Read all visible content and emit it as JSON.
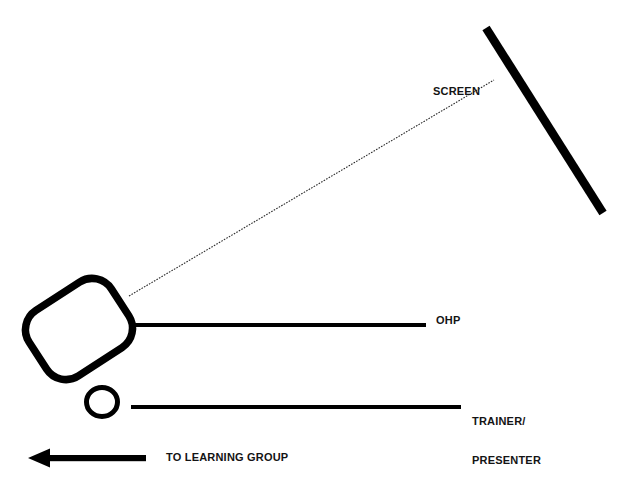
{
  "diagram": {
    "background_color": "#ffffff",
    "ink_color": "#000000",
    "labels": {
      "screen": "SCREEN",
      "ohp": "OHP",
      "trainer_line1": "TRAINER/",
      "trainer_line2": "PRESENTER",
      "learning_group": "TO LEARNING GROUP"
    },
    "shapes": {
      "screen_board": {
        "name": "screen-board",
        "type": "thick-line",
        "x1": 486,
        "y1": 28,
        "x2": 603,
        "y2": 213,
        "stroke_width": 8
      },
      "projection_beam": {
        "name": "projection-beam",
        "type": "dotted-line",
        "x1": 129,
        "y1": 296,
        "x2": 494,
        "y2": 80,
        "stroke_width": 1
      },
      "ohp_body": {
        "name": "ohp-body",
        "type": "rounded-rect-rotated",
        "cx": 79,
        "cy": 329,
        "width": 98,
        "height": 78,
        "corner_radius": 22,
        "rotation_deg": -33,
        "stroke_width": 7
      },
      "ohp_table": {
        "name": "ohp-table-line",
        "type": "thick-line",
        "x1": 133,
        "y1": 325,
        "x2": 426,
        "y2": 325,
        "stroke_width": 4
      },
      "trainer_head": {
        "name": "trainer-head-ellipse",
        "type": "ellipse",
        "cx": 102,
        "cy": 402,
        "rx": 16,
        "ry": 15,
        "stroke_width": 5
      },
      "trainer_table": {
        "name": "trainer-table-line",
        "type": "thick-line",
        "x1": 131,
        "y1": 407,
        "x2": 461,
        "y2": 407,
        "stroke_width": 4
      },
      "learning_group_arrow": {
        "name": "learning-group-arrow",
        "type": "arrow-left",
        "tip_x": 28,
        "tail_x": 146,
        "y": 458,
        "shaft_thickness": 6,
        "head_width": 22,
        "head_height": 19
      }
    }
  }
}
